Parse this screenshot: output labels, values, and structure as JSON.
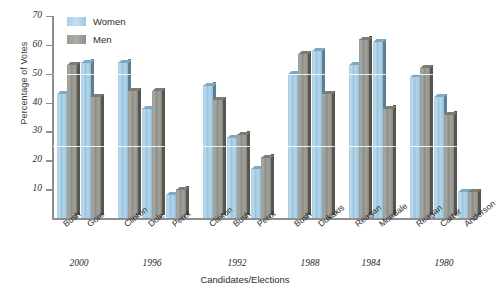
{
  "chart_data": {
    "type": "bar",
    "title": "",
    "xlabel": "Candidates/Elections",
    "ylabel": "Percentage of Votes",
    "ylim": [
      0,
      70
    ],
    "yticks": [
      10,
      20,
      30,
      40,
      50,
      60,
      70
    ],
    "grid": false,
    "legend_position": "top-left",
    "categories": [
      "Bush",
      "Gore",
      "Clinton",
      "Dole",
      "Perot",
      "Clinton",
      "Bush",
      "Perot",
      "Bush",
      "Dukakis",
      "Reagan",
      "Mondale",
      "Reagan",
      "Carter",
      "Anderson"
    ],
    "groups": [
      {
        "year": "2000",
        "candidates": [
          "Bush",
          "Gore"
        ]
      },
      {
        "year": "1996",
        "candidates": [
          "Clinton",
          "Dole",
          "Perot"
        ]
      },
      {
        "year": "1992",
        "candidates": [
          "Clinton",
          "Bush",
          "Perot"
        ]
      },
      {
        "year": "1988",
        "candidates": [
          "Bush",
          "Dukakis"
        ]
      },
      {
        "year": "1984",
        "candidates": [
          "Reagan",
          "Mondale"
        ]
      },
      {
        "year": "1980",
        "candidates": [
          "Reagan",
          "Carter",
          "Anderson"
        ]
      }
    ],
    "series": [
      {
        "name": "Women",
        "color": "#a9cfe6",
        "values": [
          43,
          54,
          54,
          38,
          8,
          46,
          28,
          17,
          50,
          58,
          53,
          61,
          49,
          42,
          9
        ]
      },
      {
        "name": "Men",
        "color": "#9b9b96",
        "values": [
          53,
          42,
          44,
          44,
          10,
          41,
          29,
          21,
          57,
          43,
          62,
          38,
          52,
          36,
          9
        ]
      }
    ]
  },
  "legend": {
    "items": [
      {
        "label": "Women",
        "color": "#a9cfe6"
      },
      {
        "label": "Men",
        "color": "#9b9b96"
      }
    ]
  },
  "axes": {
    "y_label": "Percentage of Votes",
    "x_label": "Candidates/Elections",
    "y_ticks": [
      "70",
      "60",
      "50",
      "40",
      "30",
      "20",
      "10"
    ]
  },
  "years": [
    "2000",
    "1996",
    "1992",
    "1988",
    "1984",
    "1980"
  ]
}
